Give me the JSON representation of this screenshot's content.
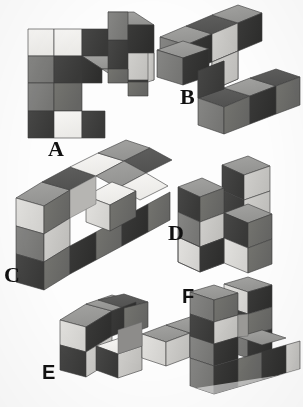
{
  "image": {
    "kind": "grayscale-photograph",
    "subject": "six three-dimensional cube assemblies built from unit cubes",
    "background_color": "#fdfdfd",
    "width": 303,
    "height": 407
  },
  "palette": {
    "white_top": "#f3f2f0",
    "white_left": "#dcdbd8",
    "white_right": "#c9c8c5",
    "gray_top": "#9a9a98",
    "gray_left": "#7e7e7c",
    "gray_right": "#6d6d6b",
    "dark_top": "#585857",
    "dark_left": "#3f3f3e",
    "dark_right": "#343433",
    "edge": "#3a3a3a",
    "label_color": "#111111"
  },
  "figures": [
    {
      "id": "A",
      "label": "A",
      "label_x": 48,
      "label_y": 140,
      "label_font": "serif",
      "description": "L-shaped assembly, tall vertical column of three cubes at left with a horizontal arm extending right and a raised cube at the upper right",
      "cube_count": 9
    },
    {
      "id": "B",
      "label": "B",
      "label_x": 180,
      "label_y": 88,
      "label_font": "serif",
      "description": "Z / staircase assembly seen in three-quarter view, two horizontal rows offset diagonally with a vertical riser between them",
      "cube_count": 9
    },
    {
      "id": "C",
      "label": "C",
      "label_x": 4,
      "label_y": 266,
      "label_font": "serif",
      "description": "Wedge-like assembly forming an open square with a hollow centre, viewed from above-left",
      "cube_count": 9
    },
    {
      "id": "D",
      "label": "D",
      "label_x": 168,
      "label_y": 224,
      "label_font": "serif",
      "description": "Staircase assembly with a cube stack rising at the upper right and an arm running down to the lower right",
      "cube_count": 9
    },
    {
      "id": "E",
      "label": "E",
      "label_x": 42,
      "label_y": 364,
      "label_font": "sans",
      "description": "Open rectangular frame assembly with a short arm extending to the right, viewed from above",
      "cube_count": 9
    },
    {
      "id": "F",
      "label": "F",
      "label_x": 182,
      "label_y": 288,
      "label_font": "sans",
      "description": "Tall assembly with a vertical block on the left, a bent arm at the top right and a long horizontal base at the bottom",
      "cube_count": 9
    }
  ]
}
